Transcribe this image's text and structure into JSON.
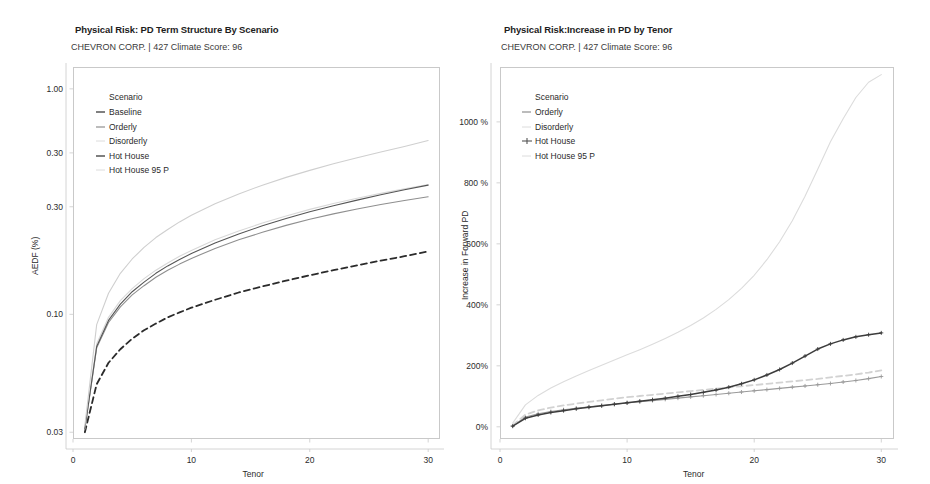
{
  "page": {
    "background": "#ffffff",
    "width": 930,
    "height": 484
  },
  "colors": {
    "baseline": "#2b2b2b",
    "orderly": "#8f8f8f",
    "disorderly": "#d8d8d8",
    "hot_house": "#555555",
    "hot_house_95p": "#cfcfcf",
    "axis": "#c9c9c9",
    "text": "#2b2b2b"
  },
  "left_panel": {
    "title": "Physical Risk: PD Term Structure By Scenario",
    "subtitle": "CHEVRON CORP. | 427 Climate Score: 96",
    "legend": {
      "title": "Scenario",
      "items": [
        {
          "label": "Baseline",
          "key": "dash-dark"
        },
        {
          "label": "Orderly",
          "key": "dash-mid"
        },
        {
          "label": "Disorderly",
          "key": "dash-faint"
        },
        {
          "label": "Hot House",
          "key": "dash-dark"
        },
        {
          "label": "Hot House 95 P",
          "key": "dash-faint"
        }
      ]
    }
  },
  "right_panel": {
    "title": "Physical Risk:Increase in PD by Tenor",
    "subtitle": "CHEVRON CORP. | 427 Climate Score: 96",
    "legend": {
      "title": "Scenario",
      "items": [
        {
          "label": "Orderly",
          "key": "dash-mid"
        },
        {
          "label": "Disorderly",
          "key": "dash-faint"
        },
        {
          "label": "Hot House",
          "key": "plus-dark"
        },
        {
          "label": "Hot House 95 P",
          "key": "dash-faint"
        }
      ]
    }
  },
  "chart_data": [
    {
      "id": "pd-term-structure",
      "type": "line",
      "title": "Physical Risk: PD Term Structure By Scenario",
      "subtitle": "CHEVRON CORP. | 427 Climate Score: 96",
      "xlabel": "Tenor",
      "ylabel": "AEDF (%)",
      "xlim": [
        0,
        31
      ],
      "ylim": [
        0.028,
        1.25
      ],
      "yscale": "log",
      "grid": false,
      "legend_position": "top-left",
      "xticks": [
        0,
        10,
        20,
        30
      ],
      "xticklabels": [
        "0",
        "10",
        "20",
        "30"
      ],
      "yticks": [
        1.0,
        0.52,
        0.3,
        0.1,
        0.03
      ],
      "yticklabels": [
        "1.00",
        "0.30",
        "0.30",
        "0.10",
        "0.03"
      ],
      "x": [
        1,
        2,
        3,
        4,
        5,
        6,
        7,
        8,
        9,
        10,
        12,
        14,
        16,
        18,
        20,
        22,
        24,
        26,
        28,
        30
      ],
      "series": [
        {
          "name": "Baseline",
          "style": "dashed",
          "color": "#2b2b2b",
          "values": [
            0.03,
            0.049,
            0.061,
            0.07,
            0.078,
            0.085,
            0.091,
            0.097,
            0.102,
            0.107,
            0.116,
            0.125,
            0.133,
            0.141,
            0.149,
            0.157,
            0.165,
            0.173,
            0.181,
            0.19
          ]
        },
        {
          "name": "Orderly",
          "style": "solid",
          "color": "#8f8f8f",
          "values": [
            0.031,
            0.071,
            0.092,
            0.108,
            0.122,
            0.134,
            0.146,
            0.157,
            0.167,
            0.177,
            0.196,
            0.214,
            0.231,
            0.248,
            0.264,
            0.279,
            0.293,
            0.307,
            0.32,
            0.332
          ]
        },
        {
          "name": "Disorderly",
          "style": "solid",
          "color": "#d8d8d8",
          "values": [
            0.031,
            0.074,
            0.097,
            0.115,
            0.13,
            0.144,
            0.157,
            0.169,
            0.181,
            0.192,
            0.214,
            0.234,
            0.254,
            0.273,
            0.292,
            0.31,
            0.327,
            0.344,
            0.36,
            0.376
          ]
        },
        {
          "name": "Hot House",
          "style": "solid",
          "color": "#555555",
          "values": [
            0.031,
            0.072,
            0.094,
            0.111,
            0.126,
            0.139,
            0.152,
            0.164,
            0.175,
            0.186,
            0.207,
            0.227,
            0.247,
            0.266,
            0.285,
            0.303,
            0.321,
            0.339,
            0.357,
            0.374
          ]
        },
        {
          "name": "Hot House 95 P",
          "style": "solid",
          "color": "#cfcfcf",
          "values": [
            0.032,
            0.09,
            0.124,
            0.152,
            0.176,
            0.198,
            0.219,
            0.238,
            0.257,
            0.275,
            0.309,
            0.342,
            0.374,
            0.405,
            0.435,
            0.465,
            0.495,
            0.525,
            0.555,
            0.59
          ]
        }
      ]
    },
    {
      "id": "increase-in-pd",
      "type": "line",
      "title": "Physical Risk:Increase in PD by Tenor",
      "subtitle": "CHEVRON CORP. | 427 Climate Score: 96",
      "xlabel": "Tenor",
      "ylabel": "Increase in Forward PD",
      "xlim": [
        0,
        31
      ],
      "ylim": [
        -40,
        1180
      ],
      "yscale": "linear",
      "grid": false,
      "legend_position": "top-left",
      "xticks": [
        0,
        10,
        20,
        30
      ],
      "xticklabels": [
        "0",
        "10",
        "20",
        "30"
      ],
      "yticks": [
        0,
        200,
        400,
        600,
        800,
        1000
      ],
      "yticklabels": [
        "0%",
        "200%",
        "400%",
        "600%",
        "800 %",
        "1000 %"
      ],
      "x": [
        1,
        2,
        3,
        4,
        5,
        6,
        7,
        8,
        9,
        10,
        11,
        12,
        13,
        14,
        15,
        16,
        17,
        18,
        19,
        20,
        21,
        22,
        23,
        24,
        25,
        26,
        27,
        28,
        29,
        30
      ],
      "series": [
        {
          "name": "Orderly",
          "style": "solid-marker",
          "color": "#9a9a9a",
          "values": [
            3,
            32,
            43,
            50,
            56,
            61,
            66,
            70,
            74,
            78,
            82,
            86,
            90,
            94,
            98,
            102,
            106,
            110,
            114,
            118,
            122,
            126,
            130,
            134,
            138,
            142,
            147,
            152,
            158,
            165
          ]
        },
        {
          "name": "Disorderly",
          "style": "dashed",
          "color": "#d2d2d2",
          "values": [
            5,
            40,
            54,
            63,
            70,
            76,
            82,
            87,
            92,
            97,
            101,
            105,
            109,
            113,
            117,
            121,
            125,
            129,
            133,
            137,
            141,
            145,
            149,
            153,
            157,
            162,
            167,
            172,
            178,
            185
          ]
        },
        {
          "name": "Hot House",
          "style": "plus-marker",
          "color": "#3c3c3c",
          "values": [
            2,
            28,
            39,
            47,
            53,
            59,
            64,
            69,
            74,
            79,
            84,
            89,
            94,
            100,
            106,
            113,
            121,
            130,
            141,
            154,
            170,
            188,
            209,
            232,
            255,
            272,
            285,
            295,
            302,
            308
          ]
        },
        {
          "name": "Hot House 95 P",
          "style": "solid",
          "color": "#dcdcdc",
          "values": [
            12,
            72,
            103,
            127,
            148,
            167,
            185,
            202,
            219,
            236,
            253,
            271,
            290,
            310,
            332,
            357,
            385,
            417,
            454,
            497,
            548,
            607,
            676,
            756,
            845,
            935,
            1010,
            1080,
            1130,
            1155
          ]
        }
      ]
    }
  ]
}
